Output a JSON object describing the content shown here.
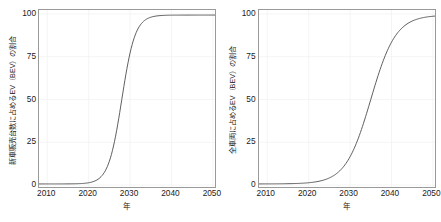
{
  "figure": {
    "background": "#ffffff",
    "line_color": "#4d4d4d",
    "grid_color": "#f2f2f2",
    "axis_color": "#9a9a9a",
    "text_color": "#1a1a1a",
    "panel_count": 2
  },
  "panels": [
    {
      "name": "new-vehicle-sales-share",
      "ylabel": "新車販売台数に占めるEV（BEV）の割合",
      "xlabel": "年",
      "yticks": [
        "0",
        "25",
        "50",
        "75",
        "100"
      ],
      "xticks": [
        "2010",
        "2020",
        "2030",
        "2040",
        "2050"
      ]
    },
    {
      "name": "total-fleet-share",
      "ylabel": "全車両に占めるEV（BEV）の割合",
      "xlabel": "年",
      "yticks": [
        "0",
        "25",
        "50",
        "75",
        "100"
      ],
      "xticks": [
        "2010",
        "2020",
        "2030",
        "2040",
        "2050"
      ]
    }
  ],
  "chart_data": [
    {
      "type": "line",
      "title": "",
      "subtitle": "",
      "xlabel": "年",
      "ylabel": "新車販売台数に占めるEV（BEV）の割合",
      "xlim": [
        2008,
        2051
      ],
      "ylim": [
        -3,
        103
      ],
      "xticks": [
        2010,
        2020,
        2030,
        2040,
        2050
      ],
      "yticks": [
        0,
        25,
        50,
        75,
        100
      ],
      "grid": true,
      "legend": "none",
      "series": [
        {
          "name": "BEV share of new vehicle sales (%)",
          "curve": "logistic",
          "midpoint_year": 2028,
          "growth_rate": 0.62,
          "asymptote": 100,
          "x": [
            2010,
            2012,
            2014,
            2016,
            2018,
            2020,
            2021,
            2022,
            2023,
            2024,
            2025,
            2026,
            2027,
            2028,
            2029,
            2030,
            2031,
            2032,
            2033,
            2034,
            2035,
            2036,
            2038,
            2040,
            2042,
            2045,
            2048,
            2050
          ],
          "values": [
            0.0,
            0.1,
            0.2,
            0.7,
            2.3,
            7.3,
            12.6,
            20.8,
            32.1,
            45.8,
            60.2,
            72.8,
            82.5,
            89.2,
            93.6,
            96.3,
            97.9,
            98.8,
            99.3,
            99.6,
            99.8,
            99.9,
            100.0,
            100.0,
            100.0,
            100.0,
            100.0,
            100.0
          ]
        }
      ]
    },
    {
      "type": "line",
      "title": "",
      "subtitle": "",
      "xlabel": "年",
      "ylabel": "全車両に占めるEV（BEV）の割合",
      "xlim": [
        2008,
        2051
      ],
      "ylim": [
        -3,
        103
      ],
      "xticks": [
        2010,
        2020,
        2030,
        2040,
        2050
      ],
      "yticks": [
        0,
        25,
        50,
        75,
        100
      ],
      "grid": true,
      "legend": "none",
      "series": [
        {
          "name": "BEV share of total vehicle fleet (%)",
          "curve": "logistic",
          "midpoint_year": 2035,
          "growth_rate": 0.33,
          "asymptote": 100,
          "x": [
            2010,
            2012,
            2014,
            2016,
            2018,
            2020,
            2022,
            2024,
            2025,
            2026,
            2027,
            2028,
            2029,
            2030,
            2031,
            2032,
            2033,
            2034,
            2035,
            2036,
            2037,
            2038,
            2039,
            2040,
            2042,
            2044,
            2046,
            2048,
            2050
          ],
          "values": [
            0.0,
            0.1,
            0.2,
            0.4,
            0.8,
            1.6,
            3.0,
            5.6,
            7.6,
            10.2,
            13.6,
            17.9,
            23.1,
            29.4,
            36.5,
            44.2,
            52.1,
            60.0,
            67.3,
            73.9,
            79.6,
            84.3,
            88.1,
            91.1,
            95.2,
            97.5,
            98.7,
            99.4,
            99.7
          ]
        }
      ]
    }
  ]
}
